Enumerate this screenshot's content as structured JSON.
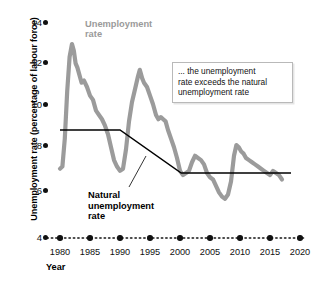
{
  "chart_data": {
    "type": "line",
    "title": "",
    "xlabel": "Year",
    "ylabel": "Unemployment rate (percentage of labour force)",
    "xlim": [
      1978,
      2020
    ],
    "ylim": [
      4,
      14
    ],
    "xticks": [
      1980,
      1985,
      1990,
      1995,
      2000,
      2005,
      2010,
      2015,
      2020
    ],
    "yticks": [
      4,
      6,
      8,
      10,
      12,
      14
    ],
    "grid": false,
    "legend_position": "inline-annotation",
    "series": [
      {
        "name": "Unemployment rate",
        "color": "#9b9b9b",
        "label_text": "Unemployment rate",
        "x": [
          1980.0,
          1980.4,
          1980.8,
          1981.2,
          1981.6,
          1982.0,
          1982.3,
          1982.6,
          1982.9,
          1983.2,
          1983.6,
          1984.0,
          1984.5,
          1985.0,
          1985.5,
          1986.0,
          1986.5,
          1987.0,
          1987.5,
          1988.0,
          1988.5,
          1989.0,
          1989.5,
          1990.0,
          1990.5,
          1991.0,
          1991.5,
          1992.0,
          1992.5,
          1993.0,
          1993.3,
          1993.7,
          1994.0,
          1994.5,
          1995.0,
          1995.5,
          1996.0,
          1996.4,
          1996.8,
          1997.2,
          1997.6,
          1998.0,
          1998.5,
          1999.0,
          1999.5,
          2000.0,
          2000.5,
          2001.0,
          2001.5,
          2002.0,
          2002.5,
          2003.0,
          2003.5,
          2004.0,
          2004.5,
          2005.0,
          2005.5,
          2006.0,
          2006.5,
          2007.0,
          2007.5,
          2008.0,
          2008.5,
          2009.0,
          2009.4,
          2009.8,
          2010.2,
          2010.6,
          2011.0,
          2011.5,
          2012.0,
          2012.5,
          2013.0,
          2013.5,
          2014.0,
          2014.5,
          2015.0,
          2015.5,
          2016.0,
          2016.5,
          2017.0
        ],
        "y": [
          7.2,
          7.3,
          8.6,
          10.8,
          12.4,
          13.0,
          12.7,
          12.1,
          11.9,
          11.6,
          11.2,
          11.3,
          11.0,
          10.6,
          10.4,
          9.9,
          9.7,
          9.5,
          9.2,
          8.8,
          8.2,
          7.6,
          7.3,
          7.1,
          7.2,
          8.1,
          9.4,
          10.3,
          10.9,
          11.5,
          11.8,
          11.4,
          11.2,
          11.0,
          10.6,
          10.2,
          9.7,
          9.5,
          9.6,
          9.5,
          9.4,
          9.0,
          8.6,
          8.2,
          7.7,
          7.1,
          6.9,
          7.0,
          7.1,
          7.5,
          7.8,
          7.7,
          7.6,
          7.4,
          7.0,
          6.8,
          6.7,
          6.4,
          6.1,
          5.9,
          5.8,
          6.0,
          6.6,
          7.8,
          8.3,
          8.2,
          8.0,
          7.9,
          7.7,
          7.6,
          7.5,
          7.4,
          7.3,
          7.2,
          7.1,
          7.0,
          6.9,
          7.1,
          7.0,
          6.9,
          6.7
        ]
      },
      {
        "name": "Natural unemployment rate",
        "color": "#000000",
        "label_text": "Natural unemployment rate",
        "x": [
          1980.0,
          1990.0,
          2000.2,
          2018.5
        ],
        "y": [
          9.0,
          9.0,
          7.0,
          7.0
        ]
      }
    ],
    "annotations": [
      {
        "id": "callout",
        "text": "... the unemployment rate exceeds the natural unemployment rate"
      }
    ]
  },
  "axes": {
    "y_title": "Unemployment rate (percentage of labour force)",
    "x_title": "Year",
    "y_tick_labels": [
      "14",
      "12",
      "10",
      "8",
      "6",
      "4"
    ],
    "x_tick_labels": [
      "1980",
      "1985",
      "1990",
      "1995",
      "2000",
      "2005",
      "2010",
      "2015",
      "2020"
    ]
  },
  "labels": {
    "series_unemployment_line1": "Unemployment",
    "series_unemployment_line2": "rate",
    "series_natural_line1": "Natural",
    "series_natural_line2": "unemployment",
    "series_natural_line3": "rate",
    "callout_line1": "... the unemployment",
    "callout_line2": "rate exceeds the natural",
    "callout_line3": "unemployment rate"
  },
  "colors": {
    "unemployment_series": "#9b9b9b",
    "natural_series": "#000000",
    "axis_text": "#111111",
    "callout_border": "#b9b9b9",
    "background": "#ffffff"
  }
}
